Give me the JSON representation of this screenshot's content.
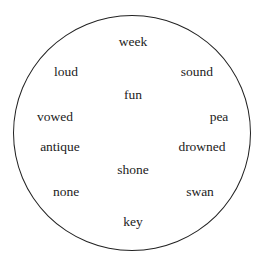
{
  "diagram": {
    "shape": "circle",
    "words": [
      {
        "text": "week",
        "x": 133,
        "y": 42
      },
      {
        "text": "loud",
        "x": 66,
        "y": 72
      },
      {
        "text": "sound",
        "x": 197,
        "y": 72
      },
      {
        "text": "fun",
        "x": 133,
        "y": 95
      },
      {
        "text": "vowed",
        "x": 55,
        "y": 117
      },
      {
        "text": "pea",
        "x": 219,
        "y": 117
      },
      {
        "text": "antique",
        "x": 60,
        "y": 147
      },
      {
        "text": "drowned",
        "x": 202,
        "y": 147
      },
      {
        "text": "shone",
        "x": 133,
        "y": 170
      },
      {
        "text": "none",
        "x": 66,
        "y": 192
      },
      {
        "text": "swan",
        "x": 200,
        "y": 192
      },
      {
        "text": "key",
        "x": 133,
        "y": 222
      }
    ]
  }
}
